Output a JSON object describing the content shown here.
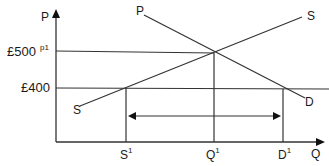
{
  "diagram": {
    "type": "supply-demand",
    "axes": {
      "y_label": "P",
      "x_label": "Q"
    },
    "price_levels": [
      {
        "label": "£500",
        "annotation": "p1"
      },
      {
        "label": "£400"
      }
    ],
    "curves": {
      "supply": {
        "start_label": "S",
        "end_label": "S"
      },
      "demand": {
        "start_label": "P",
        "end_label": "D"
      }
    },
    "quantity_markers": [
      {
        "label": "S",
        "superscript": "1"
      },
      {
        "label": "Q",
        "superscript": "1"
      },
      {
        "label": "D",
        "superscript": "1"
      }
    ],
    "gap_arrow": "double-headed arrow between S1 and D1 (excess demand at £400)"
  }
}
